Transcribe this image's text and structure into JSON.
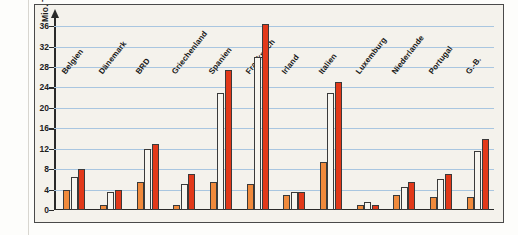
{
  "figure": {
    "frame_color": "#4a4a4a",
    "background": "#f4f2ec",
    "corner_mark": "A"
  },
  "chart_data": {
    "type": "bar",
    "title": "",
    "xlabel": "",
    "ylabel": "Mio. Touristen",
    "ylim": [
      0,
      38
    ],
    "grid": true,
    "legend": "none",
    "yticks": [
      0,
      4,
      8,
      12,
      16,
      20,
      24,
      28,
      32,
      36
    ],
    "categories": [
      "Belgien",
      "Dänemark",
      "BRD",
      "Griechenland",
      "Spanien",
      "Frankreich",
      "Irland",
      "Italien",
      "Luxemburg",
      "Niederlande",
      "Portugal",
      "G.-B."
    ],
    "series": [
      {
        "name": "series-1",
        "color": "#f08a3c",
        "values": [
          4.0,
          1.0,
          5.5,
          1.0,
          5.5,
          5.0,
          3.0,
          9.5,
          1.0,
          3.0,
          2.5,
          2.5
        ]
      },
      {
        "name": "series-2",
        "color": "#f7f5ef",
        "values": [
          6.5,
          3.5,
          12.0,
          5.0,
          23.0,
          30.0,
          3.5,
          23.0,
          1.5,
          4.5,
          6.0,
          11.5
        ]
      },
      {
        "name": "series-3",
        "color": "#e2391a",
        "values": [
          8.0,
          4.0,
          13.0,
          7.0,
          27.5,
          36.5,
          3.5,
          25.0,
          1.0,
          5.5,
          7.0,
          14.0
        ]
      }
    ]
  }
}
